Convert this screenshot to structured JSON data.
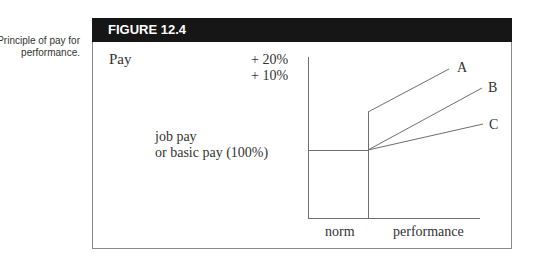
{
  "caption": [
    "Principle of pay for",
    "performance."
  ],
  "figure": {
    "title": "FIGURE 12.4",
    "y_label": "Pay",
    "increments": [
      "+ 20%",
      "+ 10%"
    ],
    "base_label": [
      "job pay",
      "or basic pay (100%)"
    ],
    "x_labels": [
      "norm",
      "performance"
    ],
    "line_labels": [
      "A",
      "B",
      "C"
    ]
  },
  "colors": {
    "header": "#161616",
    "lines": "#6e6e6e",
    "text": "#333333"
  }
}
